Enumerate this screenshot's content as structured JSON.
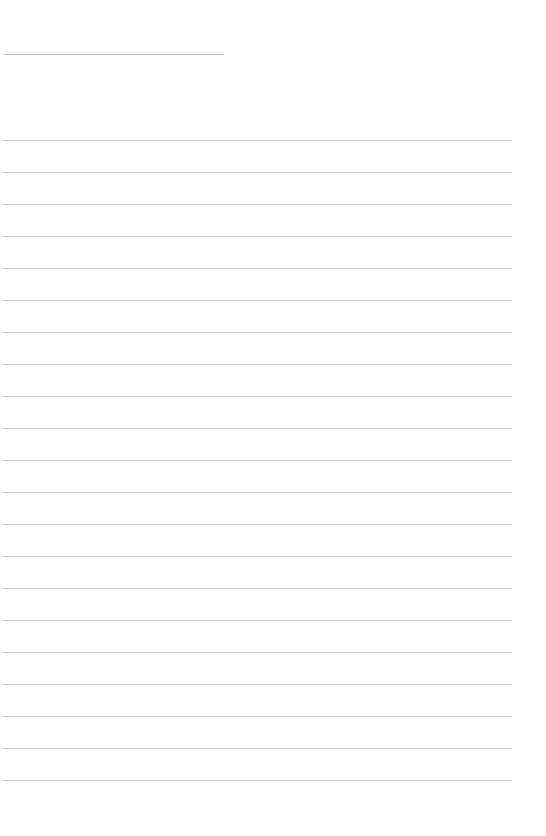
{
  "page": {
    "type": "lined-paper",
    "title_line": {
      "text": ""
    },
    "rules": {
      "count": 21,
      "first_y": 140,
      "spacing": 32,
      "color": "#c8c8c8"
    },
    "lines": [
      "",
      "",
      "",
      "",
      "",
      "",
      "",
      "",
      "",
      "",
      "",
      "",
      "",
      "",
      "",
      "",
      "",
      "",
      "",
      "",
      ""
    ]
  }
}
